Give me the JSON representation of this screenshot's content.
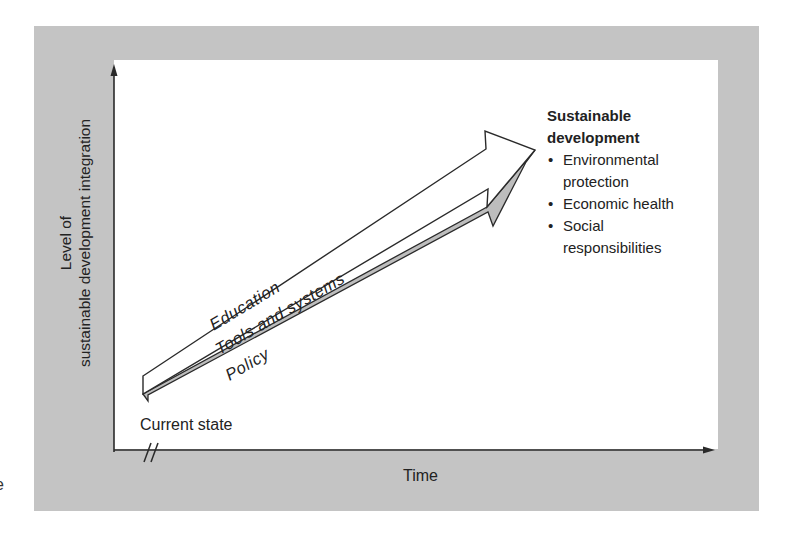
{
  "diagram": {
    "y_axis_label": {
      "line1": "Level of",
      "line2": "sustainable development integration"
    },
    "x_axis_label": "Time",
    "start_label": "Current state",
    "axis_break_symbol": "//",
    "stray_glyph": "e",
    "arrow": {
      "labels": {
        "above": "Education",
        "inside": "Tools and systems",
        "below": "Policy"
      },
      "fill_color": "#ffffff",
      "shadow_color": "#bdbdbd",
      "stroke_color": "#2a2a2a"
    },
    "goal": {
      "title_line1": "Sustainable",
      "title_line2": "development",
      "items": [
        {
          "line1": "Environmental",
          "line2": "protection"
        },
        {
          "line1": "Economic health"
        },
        {
          "line1": "Social",
          "line2": "responsibilities"
        }
      ]
    },
    "colors": {
      "frame": "#c4c4c4",
      "panel": "#ffffff",
      "ink": "#2a2a2a"
    }
  }
}
